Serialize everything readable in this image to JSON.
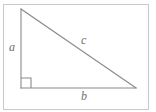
{
  "figure": {
    "kind": "right-triangle-diagram",
    "background_color": "#ffffff",
    "frame": {
      "visible": true,
      "color": "#c9c9c9",
      "x": 3.5,
      "y": 4.5,
      "width": 145,
      "height": 105
    },
    "stroke_color": "#8a8a8a",
    "stroke_width": 1.1,
    "label_color": "#707070",
    "vertices": {
      "apex": {
        "x": 21,
        "y": 9
      },
      "right_angle": {
        "x": 21,
        "y": 88
      },
      "base_right": {
        "x": 136,
        "y": 88
      }
    },
    "right_angle_marker": {
      "visible": true,
      "size": 10,
      "x": 21,
      "y": 88
    },
    "labels": {
      "leg_vertical": "a",
      "hypotenuse": "c",
      "leg_horizontal": "b"
    }
  }
}
